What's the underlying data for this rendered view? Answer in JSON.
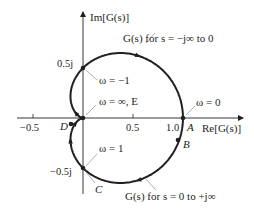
{
  "figure": {
    "axes": {
      "x_label": "Re[G(s)]",
      "y_label": "Im[G(s)]",
      "x_ticks": [
        {
          "value": -0.5,
          "label": "−0.5"
        },
        {
          "value": 0.5,
          "label": "0.5"
        },
        {
          "value": 1.0,
          "label": "1.0"
        }
      ],
      "y_ticks": [
        {
          "value": 0.5,
          "label": "0.5j"
        },
        {
          "value": -0.5,
          "label": "−0.5j"
        }
      ]
    },
    "curve": {
      "function": "G(jω) = 1/(1 + jω)^2",
      "color": "#231f20"
    },
    "points": {
      "A": {
        "label": "A",
        "re": 1.0,
        "im": 0.0
      },
      "B": {
        "label": "B",
        "re": 0.95,
        "im": -0.22
      },
      "C": {
        "label": "C",
        "re": 0.0,
        "im": -0.5
      },
      "D": {
        "label": "D",
        "re": -0.11,
        "im": -0.07
      },
      "E": {
        "label": "E",
        "re": 0.0,
        "im": 0.0
      }
    },
    "annotations": {
      "upper_branch": "G(s) for s = −j∞ to 0",
      "lower_branch": "G(s) for s = 0 to +j∞",
      "omega_neg1": "ω = −1",
      "omega_inf": "ω = ∞, E",
      "omega_0": "ω = 0",
      "omega_1": "ω = 1"
    }
  }
}
